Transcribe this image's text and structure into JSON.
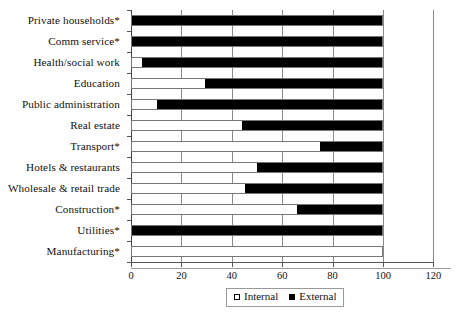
{
  "chart_data": {
    "type": "bar",
    "orientation": "horizontal",
    "stacked": true,
    "stack_mode": "percent",
    "title": "",
    "subtitle": "",
    "xlabel": "",
    "ylabel": "",
    "xlim": [
      0,
      120
    ],
    "xticks": [
      0,
      20,
      40,
      60,
      80,
      100,
      120
    ],
    "xtick_labels": [
      "0",
      "20",
      "40",
      "60",
      "80",
      "100",
      "120"
    ],
    "grid": true,
    "grid_axis": "x",
    "legend_position": "bottom-center",
    "categories": [
      "Private households*",
      "Comm service*",
      "Health/social work",
      "Education",
      "Public administration",
      "Real estate",
      "Transport*",
      "Hotels & restaurants",
      "Wholesale & retail trade",
      "Construction*",
      "Utilities*",
      "Manufacturing*"
    ],
    "series": [
      {
        "name": "Internal",
        "color": "#ffffff",
        "values": [
          0,
          0,
          4,
          29,
          10,
          44,
          75,
          50,
          45,
          66,
          0,
          100
        ]
      },
      {
        "name": "External",
        "color": "#000000",
        "values": [
          100,
          100,
          96,
          71,
          90,
          56,
          25,
          50,
          55,
          34,
          100,
          0
        ]
      }
    ]
  },
  "legend": {
    "entries": [
      {
        "label": "Internal",
        "swatch": "white-square"
      },
      {
        "label": "External",
        "swatch": "black-square"
      }
    ]
  }
}
